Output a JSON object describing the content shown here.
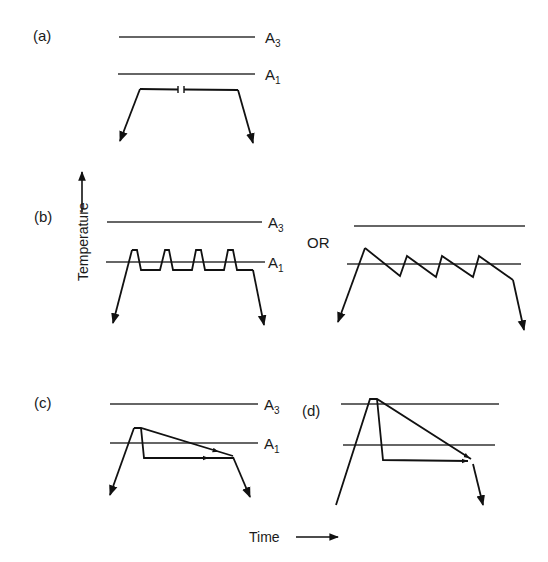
{
  "diagram": {
    "type": "heat-treatment temperature-time schematics",
    "axes": {
      "y_label": "Temperature",
      "x_label": "Time"
    },
    "critical_lines": {
      "upper": {
        "label": "A",
        "subscript": "3"
      },
      "lower": {
        "label": "A",
        "subscript": "1"
      }
    },
    "panels": [
      {
        "id": "a",
        "label": "(a)",
        "description": "Heat to just below A1, long hold (broken time axis), then cool"
      },
      {
        "id": "b",
        "label": "(b)",
        "description": "Thermal cycling about A1 with flat holds below A1",
        "alt_connector": "OR",
        "alt_description": "Sawtooth cycling above/below A1"
      },
      {
        "id": "c",
        "label": "(c)",
        "description": "Heat between A1 and A3, then slow cool through A1 or hold below A1"
      },
      {
        "id": "d",
        "label": "(d)",
        "description": "Heat above A3, then slow cool through A1 or hold below A1"
      }
    ],
    "or_text": "OR"
  }
}
